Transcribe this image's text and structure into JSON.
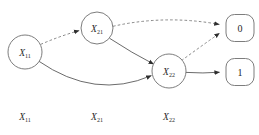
{
  "diagram": {
    "title": "",
    "background_color": "#ffffff",
    "stroke_color": "#6e6e6e",
    "arrow_color": "#2e2e2e"
  },
  "nodes": [
    {
      "id": "x11",
      "base": "X",
      "sub": "11",
      "shape": "circle",
      "cx": 25,
      "cy": 52,
      "r": 17
    },
    {
      "id": "x21",
      "base": "X",
      "sub": "21",
      "shape": "circle",
      "cx": 97,
      "cy": 28,
      "r": 16
    },
    {
      "id": "x22",
      "base": "X",
      "sub": "22",
      "shape": "circle",
      "cx": 169,
      "cy": 71,
      "r": 17
    }
  ],
  "terminals": [
    {
      "id": "t0",
      "label": "0",
      "shape": "rounded-rect",
      "cx": 240,
      "cy": 28,
      "w": 28,
      "h": 27
    },
    {
      "id": "t1",
      "label": "1",
      "shape": "rounded-rect",
      "cx": 240,
      "cy": 72,
      "w": 28,
      "h": 27
    }
  ],
  "edges": [
    {
      "id": "e1",
      "from": "x11",
      "to": "x21",
      "style": "dashed",
      "arrow": true
    },
    {
      "id": "e2",
      "from": "x11",
      "to": "x22",
      "style": "solid",
      "arrow": true
    },
    {
      "id": "e3",
      "from": "x21",
      "to": "t0",
      "style": "dashed",
      "arrow": true
    },
    {
      "id": "e4",
      "from": "x21",
      "to": "x22",
      "style": "solid",
      "arrow": true
    },
    {
      "id": "e5",
      "from": "x22",
      "to": "t0",
      "style": "dashed",
      "arrow": true
    },
    {
      "id": "e6",
      "from": "x22",
      "to": "t1",
      "style": "solid",
      "arrow": true
    }
  ],
  "column_labels": [
    {
      "id": "c1",
      "base": "X",
      "sub": "11",
      "x": 25,
      "y": 120
    },
    {
      "id": "c2",
      "base": "X",
      "sub": "21",
      "x": 97,
      "y": 120
    },
    {
      "id": "c3",
      "base": "X",
      "sub": "22",
      "x": 169,
      "y": 120
    }
  ]
}
